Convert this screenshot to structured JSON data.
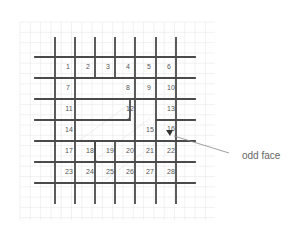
{
  "diagram": {
    "type": "planar-grid-graph",
    "background_grid": {
      "x_start": 20,
      "x_end": 215,
      "y_start": 22,
      "y_end": 220,
      "step": 10.3,
      "color": "#e6e6e6"
    },
    "vertical_lines": [
      {
        "x": 55,
        "y1": 38,
        "y2": 203
      },
      {
        "x": 75,
        "y1": 38,
        "y2": 203
      },
      {
        "x": 95,
        "y1": 38,
        "y2": 78
      },
      {
        "x": 115,
        "y1": 38,
        "y2": 78
      },
      {
        "x": 135,
        "y1": 38,
        "y2": 203
      },
      {
        "x": 156,
        "y1": 38,
        "y2": 203
      },
      {
        "x": 176,
        "y1": 38,
        "y2": 203
      },
      {
        "x": 95,
        "y1": 141,
        "y2": 203
      },
      {
        "x": 115,
        "y1": 141,
        "y2": 203
      }
    ],
    "horizontal_lines": [
      {
        "y": 57,
        "x1": 35,
        "x2": 195
      },
      {
        "y": 78,
        "x1": 35,
        "x2": 195
      },
      {
        "y": 99,
        "x1": 35,
        "x2": 195
      },
      {
        "y": 141,
        "x1": 35,
        "x2": 195
      },
      {
        "y": 162,
        "x1": 35,
        "x2": 195
      },
      {
        "y": 183,
        "x1": 35,
        "x2": 195
      },
      {
        "y": 120,
        "x1": 35,
        "x2": 130
      },
      {
        "y": 120,
        "x1": 156,
        "x2": 195
      }
    ],
    "line_color": "#4a4a4a",
    "faces": [
      {
        "label": "1",
        "x": 68,
        "y": 67
      },
      {
        "label": "2",
        "x": 88,
        "y": 67
      },
      {
        "label": "3",
        "x": 108,
        "y": 67
      },
      {
        "label": "4",
        "x": 128,
        "y": 67
      },
      {
        "label": "5",
        "x": 149,
        "y": 67
      },
      {
        "label": "6",
        "x": 169,
        "y": 67
      },
      {
        "label": "7",
        "x": 68,
        "y": 88
      },
      {
        "label": "8",
        "x": 128,
        "y": 88
      },
      {
        "label": "9",
        "x": 149,
        "y": 88
      },
      {
        "label": "10",
        "x": 171,
        "y": 88
      },
      {
        "label": "11",
        "x": 69,
        "y": 109
      },
      {
        "label": "12",
        "x": 130,
        "y": 109
      },
      {
        "label": "13",
        "x": 171,
        "y": 109
      },
      {
        "label": "14",
        "x": 69,
        "y": 130
      },
      {
        "label": "15",
        "x": 150,
        "y": 130
      },
      {
        "label": "16",
        "x": 171,
        "y": 129
      },
      {
        "label": "17",
        "x": 69,
        "y": 151
      },
      {
        "label": "18",
        "x": 90,
        "y": 151
      },
      {
        "label": "19",
        "x": 110,
        "y": 151
      },
      {
        "label": "20",
        "x": 130,
        "y": 151
      },
      {
        "label": "21",
        "x": 150,
        "y": 151
      },
      {
        "label": "22",
        "x": 171,
        "y": 151
      },
      {
        "label": "23",
        "x": 69,
        "y": 172
      },
      {
        "label": "24",
        "x": 90,
        "y": 172
      },
      {
        "label": "25",
        "x": 110,
        "y": 172
      },
      {
        "label": "26",
        "x": 130,
        "y": 172
      },
      {
        "label": "27",
        "x": 150,
        "y": 172
      },
      {
        "label": "28",
        "x": 171,
        "y": 172
      }
    ],
    "annotation": {
      "text": "odd face",
      "text_x": 242,
      "text_y": 159,
      "leader": {
        "x1": 229,
        "y1": 153,
        "x2": 174,
        "y2": 136
      },
      "marker": {
        "x": 170,
        "y": 133
      }
    }
  }
}
